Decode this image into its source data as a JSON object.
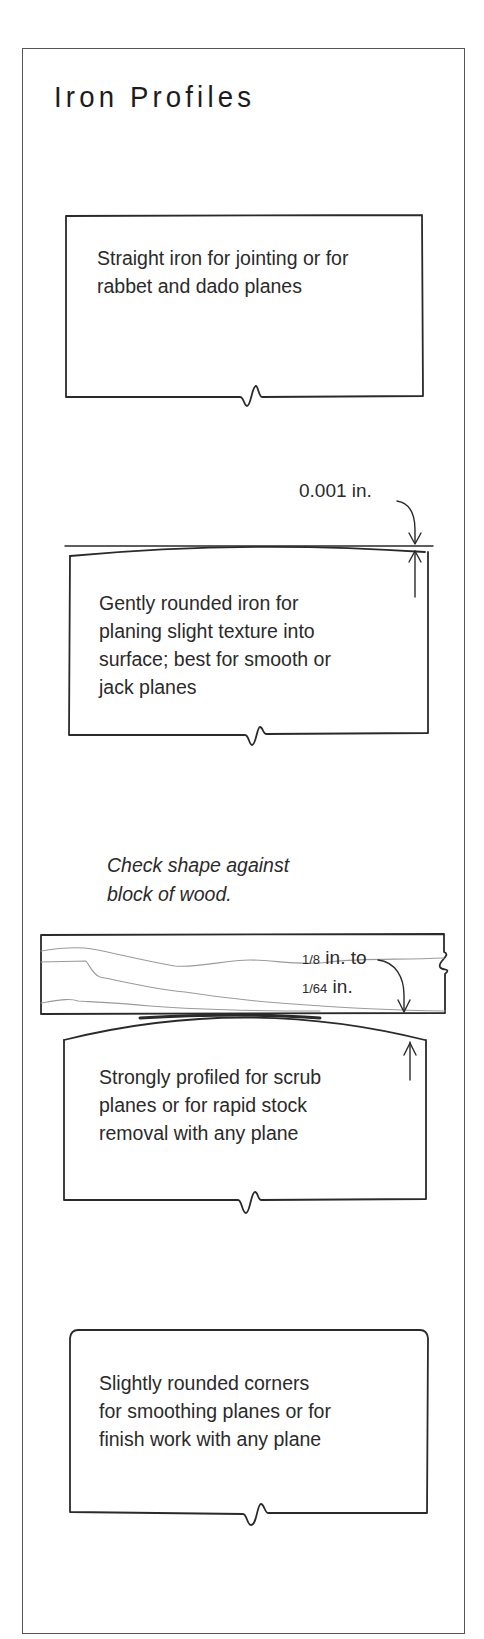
{
  "title": "Iron Profiles",
  "profiles": [
    {
      "name": "straight",
      "caption_lines": [
        "Straight iron for jointing or for",
        "rabbet and dado planes"
      ]
    },
    {
      "name": "gently-rounded",
      "caption_lines": [
        "Gently rounded iron for",
        "planing slight texture into",
        "surface; best for smooth or",
        "jack planes"
      ],
      "dimension": "0.001 in."
    },
    {
      "name": "strongly-profiled",
      "note_lines": [
        "Check shape against",
        "block of wood."
      ],
      "caption_lines": [
        "Strongly profiled for scrub",
        "planes or for rapid stock",
        "removal with any plane"
      ],
      "dimension": {
        "line1_frac": "1/8",
        "line1_rest": " in. to",
        "line2_frac": "1/64",
        "line2_rest": " in."
      }
    },
    {
      "name": "rounded-corners",
      "caption_lines": [
        "Slightly rounded corners",
        "for smoothing planes or for",
        "finish work with any plane"
      ]
    }
  ],
  "colors": {
    "ink": "#2a2a2a",
    "frame": "#555555",
    "wood_grain": "#9a9a9a",
    "background": "#ffffff"
  }
}
